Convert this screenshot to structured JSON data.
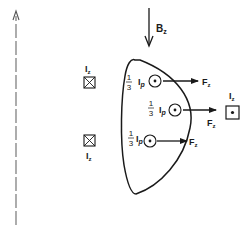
{
  "diagram": {
    "type": "plasma cross-section with current filaments and forces",
    "axis": {
      "style": "dashed",
      "direction": "up"
    },
    "field": {
      "symbol": "B",
      "subscript": "z",
      "direction": "down"
    },
    "external_coils": [
      {
        "symbol": "I",
        "subscript": "z",
        "marker": "cross",
        "position": "left-upper"
      },
      {
        "symbol": "I",
        "subscript": "z",
        "marker": "cross",
        "position": "left-lower"
      },
      {
        "symbol": "I",
        "subscript": "z",
        "marker": "dot",
        "position": "right"
      }
    ],
    "plasma_filaments": [
      {
        "fraction_num": "1",
        "fraction_den": "3",
        "symbol": "I",
        "subscript": "p",
        "marker": "dot",
        "force_symbol": "F",
        "force_subscript": "z"
      },
      {
        "fraction_num": "1",
        "fraction_den": "3",
        "symbol": "I",
        "subscript": "p",
        "marker": "dot",
        "force_symbol": "F",
        "force_subscript": "z"
      },
      {
        "fraction_num": "1",
        "fraction_den": "3",
        "symbol": "I",
        "subscript": "p",
        "marker": "dot",
        "force_symbol": "F",
        "force_subscript": "z"
      }
    ],
    "colors": {
      "ink": "#1a1a1a",
      "axis": "#6a6a6a",
      "background": "#ffffff"
    }
  }
}
